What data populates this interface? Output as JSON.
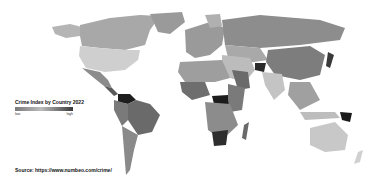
{
  "map": {
    "type": "choropleth",
    "subject": "Crime Index by Country 2022",
    "color_scale": [
      "#d8d8d8",
      "#a0a0a0",
      "#6e6e6e",
      "#1e1e1e"
    ]
  },
  "legend": {
    "title": "Crime Index by Country 2022",
    "low_label": "low",
    "high_label": "high"
  },
  "source": {
    "text": "Source: https://www.numbeo.com/crime/"
  }
}
